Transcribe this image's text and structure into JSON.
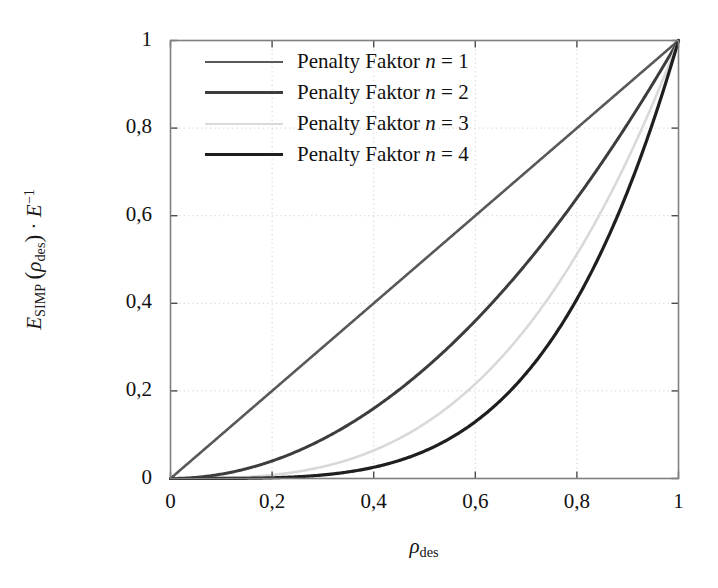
{
  "chart_data": {
    "type": "line",
    "title": "",
    "xlabel": "ρdes",
    "xlabel_base": "ρ",
    "xlabel_sub": "des",
    "ylabel": "ESIMP (ρdes) · E⁻¹",
    "ylabel_parts": {
      "e1": "E",
      "e1_sub": "SIMP",
      "open_paren": "(",
      "rho": "ρ",
      "rho_sub": "des",
      "close_paren": ")",
      "dot": "·",
      "e2": "E",
      "e2_sup": "−1"
    },
    "xlim": [
      0,
      1
    ],
    "ylim": [
      0,
      1
    ],
    "xticks": [
      0,
      0.2,
      0.4,
      0.6,
      0.8,
      1
    ],
    "yticks": [
      0,
      0.2,
      0.4,
      0.6,
      0.8,
      1
    ],
    "xticklabels": [
      "0",
      "0,2",
      "0,4",
      "0,6",
      "0,8",
      "1"
    ],
    "yticklabels": [
      "0",
      "0,2",
      "0,4",
      "0,6",
      "0,8",
      "1"
    ],
    "grid": true,
    "grid_style": "dotted",
    "grid_color": "#cfcfcf",
    "legend_position": "upper-left-inside",
    "series": [
      {
        "name": "Penalty Faktor n = 1",
        "label_prefix": "Penalty Faktor ",
        "label_var": "n",
        "label_eq": " = ",
        "label_value": "1",
        "exponent": 1,
        "color": "#595959",
        "width": 2.6,
        "x": [
          0,
          0.1,
          0.2,
          0.3,
          0.4,
          0.5,
          0.6,
          0.7,
          0.8,
          0.9,
          1
        ],
        "y": [
          0,
          0.1,
          0.2,
          0.3,
          0.4,
          0.5,
          0.6,
          0.7,
          0.8,
          0.9,
          1
        ]
      },
      {
        "name": "Penalty Faktor n = 2",
        "label_prefix": "Penalty Faktor ",
        "label_var": "n",
        "label_eq": " = ",
        "label_value": "2",
        "exponent": 2,
        "color": "#3d3d3d",
        "width": 3.0,
        "x": [
          0,
          0.1,
          0.2,
          0.3,
          0.4,
          0.5,
          0.6,
          0.7,
          0.8,
          0.9,
          1
        ],
        "y": [
          0,
          0.01,
          0.04,
          0.09,
          0.16,
          0.25,
          0.36,
          0.49,
          0.64,
          0.81,
          1
        ]
      },
      {
        "name": "Penalty Faktor n = 3",
        "label_prefix": "Penalty Faktor ",
        "label_var": "n",
        "label_eq": " = ",
        "label_value": "3",
        "exponent": 3,
        "color": "#d9d9d9",
        "width": 2.6,
        "x": [
          0,
          0.1,
          0.2,
          0.3,
          0.4,
          0.5,
          0.6,
          0.7,
          0.8,
          0.9,
          1
        ],
        "y": [
          0,
          0.001,
          0.008,
          0.027,
          0.064,
          0.125,
          0.216,
          0.343,
          0.512,
          0.729,
          1
        ]
      },
      {
        "name": "Penalty Faktor n = 4",
        "label_prefix": "Penalty Faktor ",
        "label_var": "n",
        "label_eq": " = ",
        "label_value": "4",
        "exponent": 4,
        "color": "#1f1f1f",
        "width": 3.2,
        "x": [
          0,
          0.1,
          0.2,
          0.3,
          0.4,
          0.5,
          0.6,
          0.7,
          0.8,
          0.9,
          1
        ],
        "y": [
          0,
          0.0001,
          0.0016,
          0.0081,
          0.0256,
          0.0625,
          0.1296,
          0.2401,
          0.4096,
          0.6561,
          1
        ]
      }
    ]
  },
  "axes": {
    "frame_color": "#808080",
    "tick_color": "#4d4d4d"
  }
}
